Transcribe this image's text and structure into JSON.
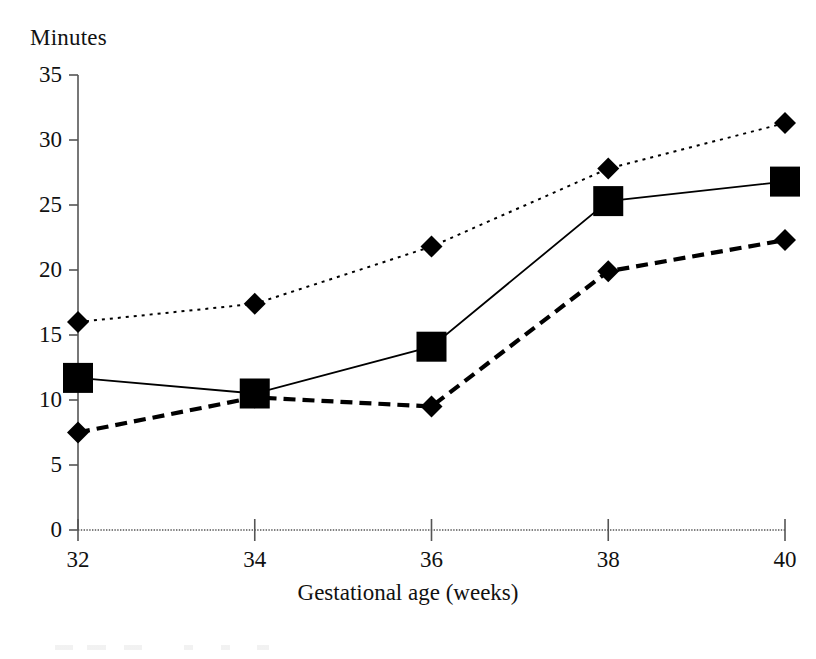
{
  "chart_data": {
    "type": "line",
    "title": "",
    "xlabel": "Gestational age (weeks)",
    "ylabel": "Minutes",
    "x": [
      32,
      34,
      36,
      38,
      40
    ],
    "xtick_labels": [
      "32",
      "34",
      "36",
      "38",
      "40"
    ],
    "ytick_labels": [
      "0",
      "5",
      "10",
      "15",
      "20",
      "25",
      "30",
      "35"
    ],
    "ytick_values": [
      0,
      5,
      10,
      15,
      20,
      25,
      30,
      35
    ],
    "xlim": [
      32,
      40
    ],
    "ylim": [
      0,
      35
    ],
    "grid": false,
    "legend_position": "none",
    "series": [
      {
        "name": "upper-series",
        "marker": "diamond",
        "line_style": "dotted",
        "color": "#000000",
        "values": [
          16.0,
          17.4,
          21.8,
          27.8,
          31.3
        ]
      },
      {
        "name": "middle-series",
        "marker": "square",
        "line_style": "solid",
        "color": "#000000",
        "values": [
          11.7,
          10.5,
          14.1,
          25.3,
          26.8
        ]
      },
      {
        "name": "lower-series",
        "marker": "diamond",
        "line_style": "dashed",
        "color": "#000000",
        "values": [
          7.5,
          10.2,
          9.5,
          19.9,
          22.3
        ]
      }
    ],
    "axis_color": "#555555"
  }
}
